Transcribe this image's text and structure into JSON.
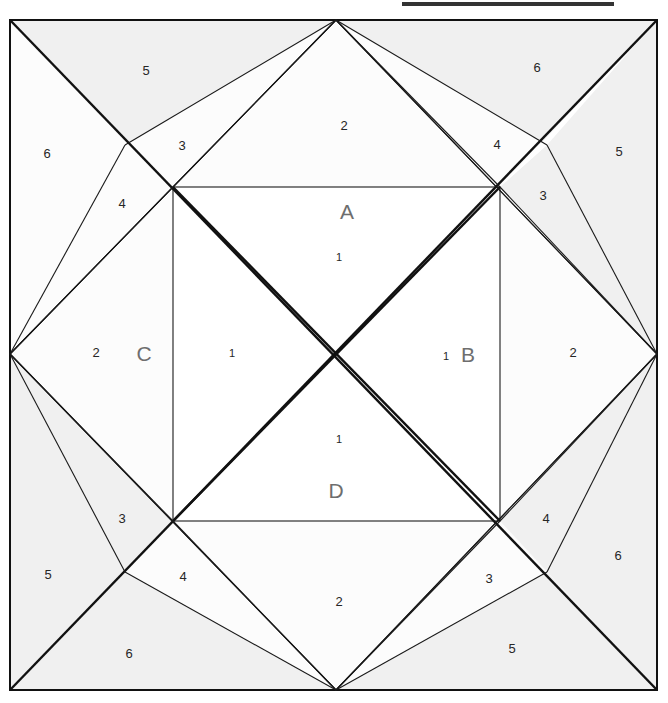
{
  "page": {
    "background_color": "#ffffff"
  },
  "topbar": {
    "name": "top-rule",
    "color": "#333333"
  },
  "figure": {
    "outer_square": {
      "left": 10,
      "top": 20,
      "right": 657,
      "bottom": 690
    },
    "inner_square": {
      "left": 173,
      "top": 187,
      "right": 500,
      "bottom": 521
    },
    "colors": {
      "shaded": "#f0f0f0",
      "unshaded": "#fcfcfc",
      "inner": "#ffffff",
      "stroke": "#1a1a1a",
      "label_gray": "#6e6e6e",
      "number_color": "#262626"
    }
  },
  "region_labels": [
    {
      "text": "A",
      "x": 347,
      "y": 213
    },
    {
      "text": "B",
      "x": 468,
      "y": 356
    },
    {
      "text": "C",
      "x": 144,
      "y": 355
    },
    {
      "text": "D",
      "x": 336,
      "y": 492
    }
  ],
  "numbers": [
    {
      "text": "1",
      "x": 339,
      "y": 258
    },
    {
      "text": "1",
      "x": 232,
      "y": 354
    },
    {
      "text": "1",
      "x": 446,
      "y": 357
    },
    {
      "text": "1",
      "x": 339,
      "y": 440
    },
    {
      "text": "2",
      "x": 344,
      "y": 127
    },
    {
      "text": "2",
      "x": 96,
      "y": 354
    },
    {
      "text": "2",
      "x": 573,
      "y": 354
    },
    {
      "text": "2",
      "x": 339,
      "y": 603
    },
    {
      "text": "3",
      "x": 182,
      "y": 147
    },
    {
      "text": "3",
      "x": 543,
      "y": 197
    },
    {
      "text": "3",
      "x": 122,
      "y": 520
    },
    {
      "text": "3",
      "x": 489,
      "y": 580
    },
    {
      "text": "4",
      "x": 122,
      "y": 205
    },
    {
      "text": "4",
      "x": 497,
      "y": 146
    },
    {
      "text": "4",
      "x": 183,
      "y": 578
    },
    {
      "text": "4",
      "x": 546,
      "y": 520
    },
    {
      "text": "5",
      "x": 146,
      "y": 72
    },
    {
      "text": "5",
      "x": 619,
      "y": 153
    },
    {
      "text": "5",
      "x": 48,
      "y": 576
    },
    {
      "text": "5",
      "x": 512,
      "y": 650
    },
    {
      "text": "6",
      "x": 537,
      "y": 69
    },
    {
      "text": "6",
      "x": 47,
      "y": 155
    },
    {
      "text": "6",
      "x": 129,
      "y": 655
    },
    {
      "text": "6",
      "x": 618,
      "y": 557
    }
  ]
}
